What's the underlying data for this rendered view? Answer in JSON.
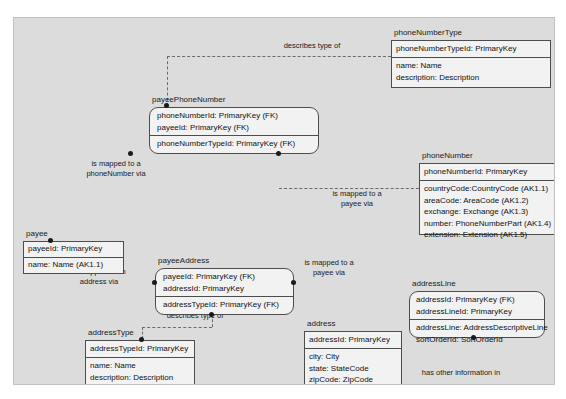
{
  "diagram": {
    "background": "#dcdcdc",
    "entity_fill": "#f2f2f2",
    "line_color": "#6b6b6b"
  },
  "entities": {
    "phoneNumberType": {
      "name": "phoneNumberType",
      "keys": [
        "phoneNumberTypeId: PrimaryKey"
      ],
      "attributes": [
        "name: Name",
        "description: Description"
      ],
      "shape": "square"
    },
    "payeePhoneNumber": {
      "name": "payeePhoneNumber",
      "keys": [
        "phoneNumberId: PrimaryKey (FK)",
        "payeeId: PrimaryKey (FK)"
      ],
      "attributes": [
        "phoneNumberTypeId: PrimaryKey (FK)"
      ],
      "shape": "rounded"
    },
    "phoneNumber": {
      "name": "phoneNumber",
      "keys": [
        "phoneNumberId: PrimaryKey"
      ],
      "attributes": [
        "countryCode:CountryCode (AK1.1)",
        "areaCode: AreaCode (AK1.2)",
        "exchange: Exchange (AK1.3)",
        "number: PhoneNumberPart (AK1.4)",
        "extension: Extension (AK1.5)"
      ],
      "shape": "square"
    },
    "payee": {
      "name": "payee",
      "keys": [
        "payeeId: PrimaryKey"
      ],
      "attributes": [
        "name: Name (AK1.1)"
      ],
      "shape": "square"
    },
    "payeeAddress": {
      "name": "payeeAddress",
      "keys": [
        "payeeId: PrimaryKey (FK)",
        "addressId: PrimaryKey"
      ],
      "attributes": [
        "addressTypeId: PrimaryKey (FK)"
      ],
      "shape": "rounded"
    },
    "addressType": {
      "name": "addressType",
      "keys": [
        "addressTypeId: PrimaryKey"
      ],
      "attributes": [
        "name: Name",
        "description: Description"
      ],
      "shape": "square"
    },
    "address": {
      "name": "address",
      "keys": [
        "addressId: PrimaryKey"
      ],
      "attributes": [
        "city: City",
        "state: StateCode",
        "zipCode: ZipCode"
      ],
      "shape": "square"
    },
    "addressLine": {
      "name": "addressLine",
      "keys": [
        "addressId: PrimaryKey (FK)",
        "addressLineId: PrimaryKey"
      ],
      "attributes": [
        "addressLine: AddressDescriptiveLine",
        "sortOrderId: SortOrderId"
      ],
      "shape": "rounded"
    }
  },
  "relationships": {
    "describes_type_of_phone": "describes type of",
    "mapped_to_phonenumber": "is mapped to a\nphoneNumber via",
    "mapped_to_payee_phone": "is mapped to a\npayee via",
    "mapped_to_address": "is mapped to an\naddress via",
    "mapped_to_payee_addr": "is mapped to a\npayee via",
    "describes_type_of_address": "describes type of",
    "has_other_information_in": "has other information in"
  }
}
